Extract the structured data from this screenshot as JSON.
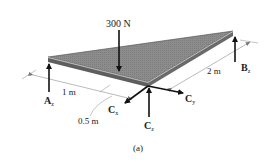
{
  "figure": {
    "caption": "(a)",
    "colors": {
      "plate_top": "#8a8a8a",
      "plate_edge": "#5a5a5a",
      "plate_edge_highlight": "#d8d8d8",
      "arrow": "#111111",
      "dimension_line": "#777777",
      "text": "#222222"
    },
    "loads": {
      "applied_force": {
        "label": "300 N"
      }
    },
    "reactions": {
      "A": {
        "main": "A",
        "sub": "z"
      },
      "B": {
        "main": "B",
        "sub": "z"
      },
      "Cx": {
        "main": "C",
        "sub": "x"
      },
      "Cy": {
        "main": "C",
        "sub": "y"
      },
      "Cz": {
        "main": "C",
        "sub": "z"
      }
    },
    "dimensions": {
      "d1": "1 m",
      "d2": "0.5 m",
      "d3": "2 m"
    }
  }
}
